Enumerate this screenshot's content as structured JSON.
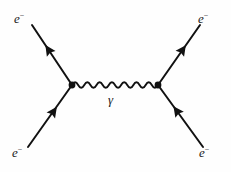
{
  "diagram": {
    "type": "feynman-diagram",
    "process_name": "Moller scattering",
    "title": "",
    "background_color": "#fefefe",
    "line_color": "#111111",
    "label_color": "#1a1a1a",
    "canvas": {
      "width": 231,
      "height": 172
    },
    "labels": {
      "electron_symbol": "e",
      "electron_charge": "−",
      "photon_symbol": "γ"
    },
    "vertices": [
      {
        "name": "left-vertex",
        "x": 72,
        "y": 85,
        "radius": 3.4
      },
      {
        "name": "right-vertex",
        "x": 158,
        "y": 85,
        "radius": 3.4
      }
    ],
    "fermion_lines": [
      {
        "name": "incoming-electron-lower-left",
        "from": {
          "x": 28,
          "y": 147
        },
        "to": {
          "x": 72,
          "y": 85
        },
        "arrow_direction": "toward-vertex",
        "arrow_at": 0.52,
        "label_position": "lower-left"
      },
      {
        "name": "outgoing-electron-upper-left",
        "from": {
          "x": 72,
          "y": 85
        },
        "to": {
          "x": 32,
          "y": 25
        },
        "arrow_direction": "away-from-vertex",
        "arrow_at": 0.52,
        "label_position": "upper-left"
      },
      {
        "name": "outgoing-electron-upper-right",
        "from": {
          "x": 158,
          "y": 85
        },
        "to": {
          "x": 200,
          "y": 25
        },
        "arrow_direction": "away-from-vertex",
        "arrow_at": 0.52,
        "label_position": "upper-right"
      },
      {
        "name": "incoming-electron-lower-right",
        "from": {
          "x": 203,
          "y": 147
        },
        "to": {
          "x": 158,
          "y": 85
        },
        "arrow_direction": "toward-vertex",
        "arrow_at": 0.52,
        "label_position": "lower-right"
      }
    ],
    "boson_line": {
      "name": "virtual-photon",
      "style": "wavy",
      "from": {
        "x": 72,
        "y": 85
      },
      "to": {
        "x": 158,
        "y": 85
      },
      "cycles": 7,
      "amplitude": 4.2
    },
    "stroke_width": 2.0,
    "arrow_size": 9
  }
}
